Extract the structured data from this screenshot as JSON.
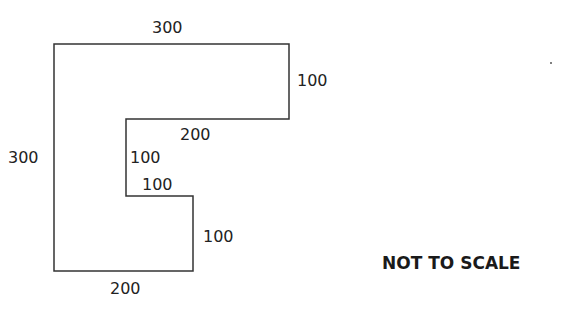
{
  "diagram": {
    "type": "rectilinear-shape",
    "stroke_color": "#333333",
    "vertices": [
      [
        54,
        44
      ],
      [
        289,
        44
      ],
      [
        289,
        119
      ],
      [
        126,
        119
      ],
      [
        126,
        196
      ],
      [
        193,
        196
      ],
      [
        193,
        271
      ],
      [
        54,
        271
      ]
    ],
    "labels": {
      "top": "300",
      "right_upper": "100",
      "inner_top": "200",
      "left": "300",
      "inner_left": "100",
      "notch_top": "100",
      "right_lower": "100",
      "bottom": "200"
    },
    "note": "NOT TO SCALE"
  }
}
